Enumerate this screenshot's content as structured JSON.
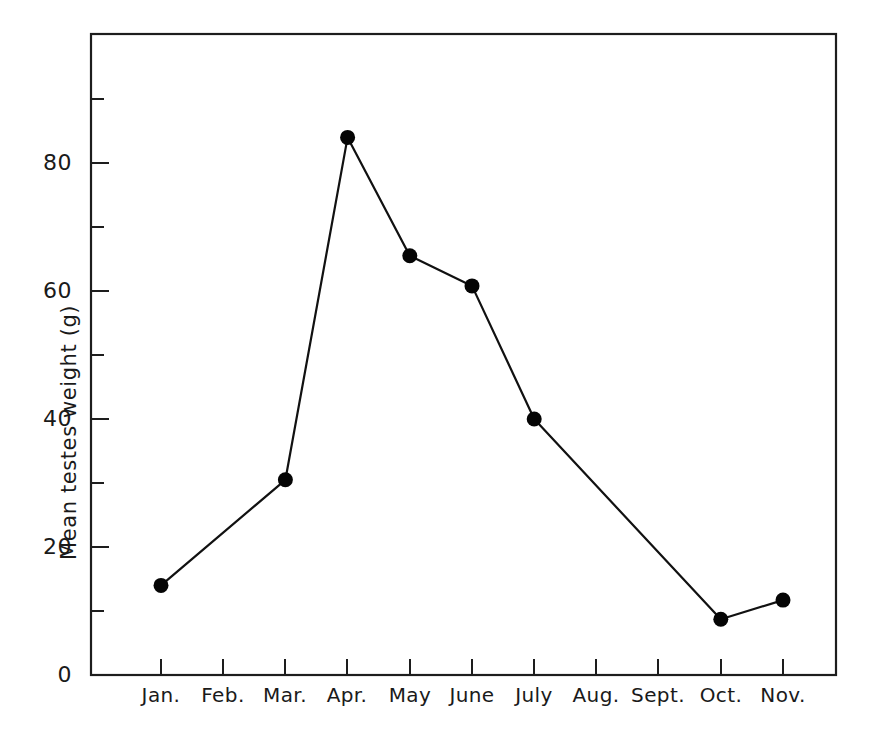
{
  "chart_data": {
    "type": "line",
    "title": "",
    "subtitle": "",
    "xlabel": "",
    "ylabel": "Mean testes weight (g)",
    "categories": [
      "Jan.",
      "Feb.",
      "Mar.",
      "Apr.",
      "May",
      "June",
      "July",
      "Aug.",
      "Sept.",
      "Oct.",
      "Nov."
    ],
    "values": [
      14,
      null,
      30.5,
      84,
      65.5,
      60.8,
      40,
      null,
      null,
      8.7,
      11.7
    ],
    "series": [
      {
        "name": "Mean testes weight",
        "points": [
          {
            "category": "Jan.",
            "value": 14
          },
          {
            "category": "Mar.",
            "value": 30.5
          },
          {
            "category": "Apr.",
            "value": 84
          },
          {
            "category": "May",
            "value": 65.5
          },
          {
            "category": "June",
            "value": 60.8
          },
          {
            "category": "July",
            "value": 40
          },
          {
            "category": "Oct.",
            "value": 8.7
          },
          {
            "category": "Nov.",
            "value": 11.7
          }
        ]
      }
    ],
    "missing_categories": [
      "Feb.",
      "Aug.",
      "Sept."
    ],
    "ylim": [
      0,
      96
    ],
    "ytick_labels": [
      "0",
      "20",
      "40",
      "60",
      "80"
    ],
    "ytick_values": [
      0,
      20,
      40,
      60,
      80
    ],
    "yminor_tick_values": [
      10,
      30,
      50,
      70,
      90
    ],
    "grid": false,
    "legend": false,
    "legend_position": "none",
    "marker": "filled-circle",
    "line_color": "#111111",
    "marker_color": "#050505",
    "axis_color": "#1d1d1d",
    "background_color": "#ffffff",
    "frame": "box"
  },
  "axis": {
    "y_title": "Mean testes weight (g)",
    "y_labels": [
      "80",
      "60",
      "40",
      "20",
      "0"
    ],
    "x_labels": [
      "Jan.",
      "Feb.",
      "Mar.",
      "Apr.",
      "May",
      "June",
      "July",
      "Aug.",
      "Sept.",
      "Oct.",
      "Nov."
    ]
  }
}
